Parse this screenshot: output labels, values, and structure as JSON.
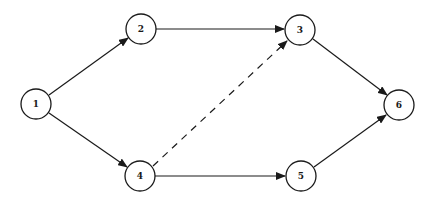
{
  "diagram": {
    "type": "network",
    "nodes": [
      {
        "id": "1",
        "label": "1",
        "x": 36,
        "y": 104
      },
      {
        "id": "2",
        "label": "2",
        "x": 141,
        "y": 29
      },
      {
        "id": "3",
        "label": "3",
        "x": 300,
        "y": 30
      },
      {
        "id": "4",
        "label": "4",
        "x": 140,
        "y": 176
      },
      {
        "id": "5",
        "label": "5",
        "x": 301,
        "y": 176
      },
      {
        "id": "6",
        "label": "6",
        "x": 399,
        "y": 105
      }
    ],
    "node_radius": 15,
    "edges": [
      {
        "from": "1",
        "to": "2",
        "style": "solid"
      },
      {
        "from": "1",
        "to": "4",
        "style": "solid"
      },
      {
        "from": "2",
        "to": "3",
        "style": "solid"
      },
      {
        "from": "4",
        "to": "3",
        "style": "dashed"
      },
      {
        "from": "4",
        "to": "5",
        "style": "solid"
      },
      {
        "from": "3",
        "to": "6",
        "style": "solid"
      },
      {
        "from": "5",
        "to": "6",
        "style": "solid"
      }
    ],
    "colors": {
      "stroke": "#1a1a1a",
      "background": "#ffffff"
    }
  }
}
